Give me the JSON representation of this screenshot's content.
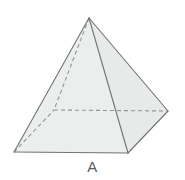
{
  "figure": {
    "label": "A",
    "shape_name": "square-pyramid",
    "colors": {
      "background": "#ffffff",
      "face_front_left": "#eceeee",
      "face_front_right": "#e8eaea",
      "face_base_hidden": "#f1f3f3",
      "outline": "#6e7476",
      "hidden_edge": "#8f9598",
      "caption_text": "#5b5b5b"
    },
    "geometry": {
      "apex": {
        "x": 89,
        "y": 18
      },
      "base_front_left": {
        "x": 14,
        "y": 152
      },
      "base_front_right": {
        "x": 128,
        "y": 153
      },
      "base_right": {
        "x": 168,
        "y": 111
      },
      "base_back_left_hidden": {
        "x": 54,
        "y": 110
      }
    },
    "edges": [
      {
        "name": "apex-to-front-left",
        "hidden": false
      },
      {
        "name": "apex-to-front-right",
        "hidden": false
      },
      {
        "name": "apex-to-right",
        "hidden": false
      },
      {
        "name": "apex-to-back-left",
        "hidden": true
      },
      {
        "name": "front-left-to-front-right",
        "hidden": false
      },
      {
        "name": "front-right-to-right",
        "hidden": false
      },
      {
        "name": "front-left-to-back-left",
        "hidden": true
      },
      {
        "name": "back-left-to-right",
        "hidden": true
      }
    ],
    "stroke_widths": {
      "solid": 1.1,
      "hidden": 1.1
    },
    "hidden_dash_pattern": "4 3"
  }
}
